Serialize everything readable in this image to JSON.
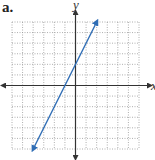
{
  "figure_label": "a.",
  "chart_data": {
    "type": "line",
    "title": "",
    "xlabel": "x",
    "ylabel": "y",
    "xlim": [
      -6,
      6
    ],
    "ylim": [
      -6,
      6
    ],
    "grid": true,
    "grid_style": "dotted",
    "tick_labels": false,
    "series": [
      {
        "name": "y = 2x + 2",
        "equation": "y = 2x + 2",
        "slope": 2,
        "y_intercept": 2,
        "x_intercept": -1,
        "x": [
          -4,
          2
        ],
        "y": [
          -6,
          6
        ],
        "arrows_both_ends": true,
        "color": "#2f6db5"
      }
    ]
  },
  "colors": {
    "line": "#2f6db5",
    "axis": "#333333",
    "grid": "#9a9a9a"
  }
}
